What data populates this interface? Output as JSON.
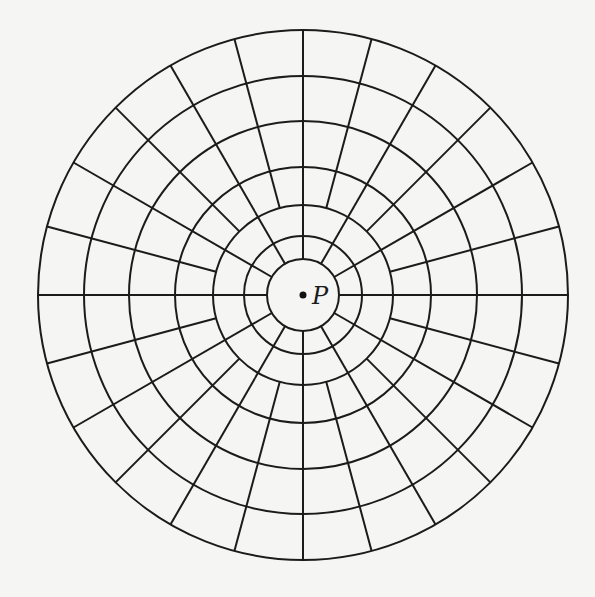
{
  "diagram": {
    "type": "polar-grid",
    "center": {
      "x": 303,
      "y": 295,
      "label": "P"
    },
    "ring_radii": [
      36,
      59,
      90,
      128,
      174,
      219,
      265
    ],
    "spokes": {
      "primary": {
        "angle_step_deg": 30,
        "count": 12,
        "start_radius": 36,
        "end_radius": 265
      },
      "secondary": {
        "angle_step_deg": 30,
        "angle_offset_deg": 15,
        "count": 12,
        "start_radius": 90,
        "end_radius": 265
      }
    },
    "colors": {
      "stroke": "#1b1b1b",
      "background": "#f5f5f4"
    }
  }
}
